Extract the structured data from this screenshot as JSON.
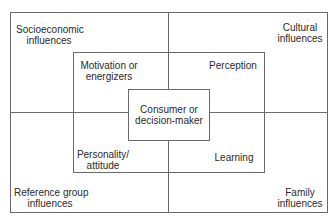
{
  "diagram": {
    "outer_quadrants": {
      "top_left": [
        "Socioeconomic",
        "influences"
      ],
      "top_right": [
        "Cultural",
        "influences"
      ],
      "bottom_left": [
        "Reference group",
        "influences"
      ],
      "bottom_right": [
        "Family",
        "influences"
      ]
    },
    "middle_quadrants": {
      "top_left": [
        "Motivation or",
        "energizers"
      ],
      "top_right": [
        "Perception"
      ],
      "bottom_left": [
        "Personality/",
        "attitude"
      ],
      "bottom_right": [
        "Learning"
      ]
    },
    "center": [
      "Consumer or",
      "decision-maker"
    ],
    "colors": {
      "line": "#6a6a6a",
      "text": "#2a2a2a",
      "background": "#ffffff"
    }
  }
}
